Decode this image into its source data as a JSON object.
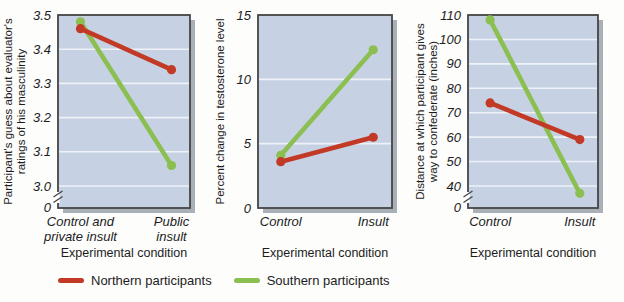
{
  "colors": {
    "plot_bg": "#c6d1e3",
    "grid": "#eef2f8",
    "frame": "#454545",
    "shadow": "#aab0b8",
    "text": "#1c1c1c",
    "northern": "#c23a26",
    "southern": "#8cbf51"
  },
  "legend": {
    "items": [
      {
        "id": "northern",
        "label": "Northern participants",
        "color": "#c23a26"
      },
      {
        "id": "southern",
        "label": "Southern participants",
        "color": "#8cbf51"
      }
    ]
  },
  "chart_data": [
    {
      "id": "masculinity",
      "type": "line",
      "ylabel_lines": [
        "Participant's guess about evaluator's",
        "ratings of his masculinity"
      ],
      "xlabel": "Experimental condition",
      "categories": [
        "Control and\nprivate insult",
        "Public\ninsult"
      ],
      "ymax": 3.5,
      "ymin_display": 3.0,
      "axis_break": true,
      "zero_label": "0",
      "yticks": [
        {
          "v": 3.5,
          "label": "3.5"
        },
        {
          "v": 3.4,
          "label": "3.4"
        },
        {
          "v": 3.3,
          "label": "3.3"
        },
        {
          "v": 3.2,
          "label": "3.2"
        },
        {
          "v": 3.1,
          "label": "3.1"
        },
        {
          "v": 3.0,
          "label": "3.0"
        }
      ],
      "series": [
        {
          "name": "Northern participants",
          "color_key": "northern",
          "values": [
            3.46,
            3.34
          ]
        },
        {
          "name": "Southern participants",
          "color_key": "southern",
          "values": [
            3.48,
            3.06
          ]
        }
      ]
    },
    {
      "id": "testosterone",
      "type": "line",
      "ylabel_lines": [
        "Percent change in testosterone level"
      ],
      "xlabel": "Experimental condition",
      "categories": [
        "Control",
        "Insult"
      ],
      "ymax": 15,
      "ymin_display": 0,
      "axis_break": false,
      "yticks": [
        {
          "v": 15,
          "label": "15"
        },
        {
          "v": 10,
          "label": "10"
        },
        {
          "v": 5,
          "label": "5"
        },
        {
          "v": 0,
          "label": "0"
        }
      ],
      "series": [
        {
          "name": "Northern participants",
          "color_key": "northern",
          "values": [
            3.6,
            5.5
          ]
        },
        {
          "name": "Southern participants",
          "color_key": "southern",
          "values": [
            4.1,
            12.3
          ]
        }
      ]
    },
    {
      "id": "distance",
      "type": "line",
      "ylabel_lines": [
        "Distance at which participant gives",
        "way to confederate (inches)"
      ],
      "xlabel": "Experimental condition",
      "categories": [
        "Control",
        "Insult"
      ],
      "ymax": 110,
      "ymin_display": 40,
      "axis_break": true,
      "zero_label": "0",
      "yticks": [
        {
          "v": 110,
          "label": "110"
        },
        {
          "v": 100,
          "label": "100"
        },
        {
          "v": 90,
          "label": "90"
        },
        {
          "v": 80,
          "label": "80"
        },
        {
          "v": 70,
          "label": "70"
        },
        {
          "v": 60,
          "label": "60"
        },
        {
          "v": 50,
          "label": "50"
        },
        {
          "v": 40,
          "label": "40"
        }
      ],
      "series": [
        {
          "name": "Northern participants",
          "color_key": "northern",
          "values": [
            74,
            59
          ]
        },
        {
          "name": "Southern participants",
          "color_key": "southern",
          "values": [
            108,
            37
          ]
        }
      ]
    }
  ]
}
